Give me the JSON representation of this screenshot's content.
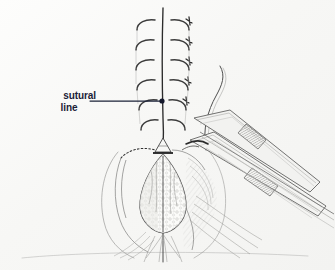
{
  "figure": {
    "kind": "medical-surgical-illustration",
    "background_color": "#fbfbfa",
    "ink_color": "#4a4a4a",
    "dark_ink_color": "#222222",
    "label_color": "#1b2238",
    "width": 335,
    "height": 270
  },
  "annotations": {
    "callout": {
      "name": "sutural-line-callout",
      "line1": "sutural",
      "line2": "line",
      "leader": {
        "x1": 90,
        "y1": 101,
        "x2": 160,
        "y2": 101,
        "dot_x": 162,
        "dot_y": 101,
        "dot_radius": 2.6,
        "color": "#1b2238"
      }
    }
  },
  "drawing": {
    "midline": {
      "name": "vertical-suture-midline",
      "x": 163,
      "y_top": 8,
      "y_bottom": 262
    },
    "stitches_left": [
      {
        "y": 24
      },
      {
        "y": 44
      },
      {
        "y": 64
      },
      {
        "y": 84
      },
      {
        "y": 104
      },
      {
        "y": 124
      }
    ],
    "stitches_right": [
      {
        "y": 23
      },
      {
        "y": 43
      },
      {
        "y": 63
      },
      {
        "y": 83
      },
      {
        "y": 103
      },
      {
        "y": 123
      }
    ],
    "wound": {
      "name": "open-incision",
      "apex_x": 163,
      "apex_y": 152,
      "bottom_y": 232,
      "half_width": 32
    },
    "instruments": [
      {
        "name": "retractor-upper",
        "angle": "down-right"
      },
      {
        "name": "retractor-lower",
        "angle": "down-right"
      },
      {
        "name": "forceps-shaft",
        "angle": "down-right"
      }
    ],
    "suture_thread": {
      "name": "free-suture-thread"
    }
  }
}
